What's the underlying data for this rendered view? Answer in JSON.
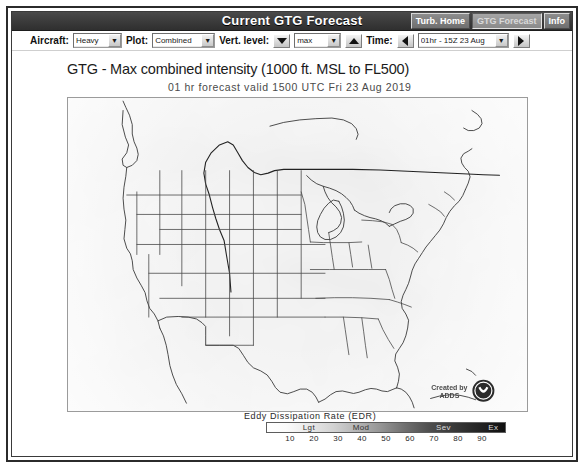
{
  "window": {
    "title": "Current GTG Forecast",
    "nav_buttons": [
      {
        "label": "Turb. Home",
        "active": false
      },
      {
        "label": "GTG Forecast",
        "active": true
      },
      {
        "label": "Info",
        "active": false
      }
    ]
  },
  "controls": {
    "aircraft": {
      "label": "Aircraft:",
      "value": "Heavy"
    },
    "plot": {
      "label": "Plot:",
      "value": "Combined"
    },
    "vert_level": {
      "label": "Vert. level:",
      "value": "max",
      "down_icon": "triangle-down-icon",
      "up_icon": "triangle-up-icon"
    },
    "time": {
      "label": "Time:",
      "value": "01hr - 15Z 23 Aug",
      "prev_icon": "triangle-left-icon",
      "next_icon": "triangle-right-icon"
    }
  },
  "chart": {
    "title": "GTG - Max combined intensity (1000 ft. MSL to FL500)",
    "subtitle": "01 hr forecast valid 1500 UTC Fri 23 Aug 2019",
    "credit": "Created by ADDS"
  },
  "legend": {
    "title": "Eddy Dissipation Rate (EDR)",
    "bands": [
      {
        "label": "Lgt",
        "pos": 18
      },
      {
        "label": "Mod",
        "pos": 38
      },
      {
        "label": "Sev",
        "pos": 72
      },
      {
        "label": "Ex",
        "pos": 94
      }
    ],
    "ticks": [
      {
        "label": "10",
        "pos": 10
      },
      {
        "label": "20",
        "pos": 20
      },
      {
        "label": "30",
        "pos": 30
      },
      {
        "label": "40",
        "pos": 40
      },
      {
        "label": "50",
        "pos": 50
      },
      {
        "label": "60",
        "pos": 60
      },
      {
        "label": "70",
        "pos": 70
      },
      {
        "label": "80",
        "pos": 80
      },
      {
        "label": "90",
        "pos": 90
      }
    ]
  },
  "chart_data": {
    "type": "heatmap",
    "title": "GTG - Max combined intensity (1000 ft. MSL to FL500)",
    "subtitle": "01 hr forecast valid 1500 UTC Fri 23 Aug 2019",
    "xlabel": "",
    "ylabel": "",
    "colorbar_label": "Eddy Dissipation Rate (EDR)",
    "colorbar_ticks": [
      10,
      20,
      30,
      40,
      50,
      60,
      70,
      80,
      90
    ],
    "colorbar_bands": [
      "Lgt",
      "Mod",
      "Sev",
      "Ex"
    ],
    "colormap": "grayscale-white-to-black",
    "region": "Contiguous United States",
    "note": "Field is almost entirely at the low end of the EDR scale (light gray, below Lgt threshold) across CONUS; faint slightly-darker streaks over the northern Rockies/High Plains and the Ohio Valley."
  }
}
